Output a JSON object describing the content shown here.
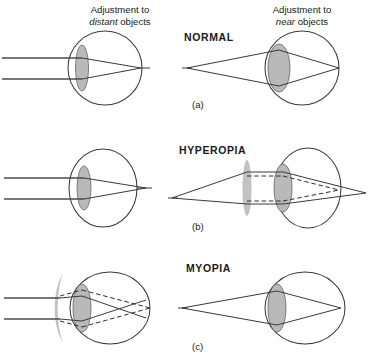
{
  "figure": {
    "width": 368,
    "height": 364
  },
  "colors": {
    "stroke": "#3a3a3a",
    "lens_fill": "#b9b9b9",
    "corrective_lens_fill": "#c2c2c2",
    "text": "#1a1a1a",
    "background": "#ffffff"
  },
  "panels": [
    {
      "id": "a",
      "letter": "(a)",
      "condition": "NORMAL",
      "left_caption_line1": "Adjustment to",
      "left_caption_em": "distant",
      "left_caption_line2_tail": " objects",
      "right_caption_line1": "Adjustment to",
      "right_caption_em": "near",
      "right_caption_line2_tail": " objects",
      "left_eye": {
        "name": "normal-eye-distant",
        "lens": "thin-relaxed-lens",
        "rays": "parallel-rays",
        "focus": "on-retina"
      },
      "right_eye": {
        "name": "normal-eye-near",
        "lens": "thick-accommodated-lens",
        "rays": "diverging-rays-from-near-point",
        "focus": "on-retina"
      },
      "corrective_lens": null
    },
    {
      "id": "b",
      "letter": "(b)",
      "condition": "HYPEROPIA",
      "left_caption_line1": "",
      "left_caption_em": "",
      "left_caption_line2_tail": "",
      "right_caption_line1": "",
      "right_caption_em": "",
      "right_caption_line2_tail": "",
      "left_eye": {
        "name": "hyperopic-eye-uncorrected",
        "lens": "thin-lens",
        "rays": "parallel-rays",
        "focus": "behind-retina"
      },
      "right_eye": {
        "name": "hyperopic-eye-corrected",
        "lens": "thin-lens",
        "rays": "near-object-rays-solid-and-corrected-dashed",
        "focus": "corrected-on-retina"
      },
      "corrective_lens": "convex-converging-lens"
    },
    {
      "id": "c",
      "letter": "(c)",
      "condition": "MYOPIA",
      "left_caption_line1": "",
      "left_caption_em": "",
      "left_caption_line2_tail": "",
      "right_caption_line1": "",
      "right_caption_em": "",
      "right_caption_line2_tail": "",
      "left_eye": {
        "name": "myopic-eye-corrected",
        "lens": "thick-lens",
        "rays": "parallel-rays-solid-and-corrected-dashed",
        "focus": "corrected-on-retina"
      },
      "right_eye": {
        "name": "myopic-eye-near",
        "lens": "thick-lens",
        "rays": "near-object-rays",
        "focus": "on-retina"
      },
      "corrective_lens": "concave-diverging-lens"
    }
  ]
}
